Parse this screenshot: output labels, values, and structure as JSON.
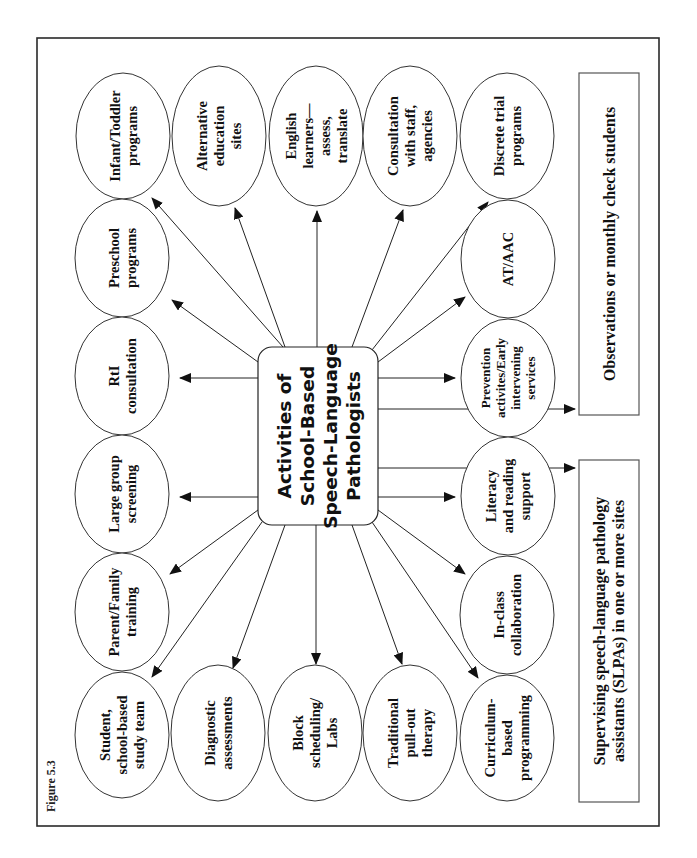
{
  "figure_label": "Figure 5.3",
  "center": {
    "lines": [
      "Activities of",
      "School-Based",
      "Speech-Language",
      "Pathologists"
    ]
  },
  "activities": {
    "infant_toddler": [
      "Infant/Toddler",
      "programs"
    ],
    "alternative_education": [
      "Alternative",
      "education",
      "sites"
    ],
    "english_learners": [
      "English",
      "learners—",
      "assess,",
      "translate"
    ],
    "consultation_staff": [
      "Consultation",
      "with staff,",
      "agencies"
    ],
    "discrete_trial": [
      "Discrete trial",
      "programs"
    ],
    "preschool": [
      "Preschool",
      "programs"
    ],
    "rti": [
      "RtI",
      "consultation"
    ],
    "large_group": [
      "Large group",
      "screening"
    ],
    "parent_family": [
      "Parent/Family",
      "training"
    ],
    "student_team": [
      "Student,",
      "school-based",
      "study team"
    ],
    "diagnostic": [
      "Diagnostic",
      "assessments"
    ],
    "block_scheduling": [
      "Block",
      "scheduling/",
      "Labs"
    ],
    "traditional_pullout": [
      "Traditional",
      "pull-out",
      "therapy"
    ],
    "curriculum_based": [
      "Curriculum-",
      "based",
      "programming"
    ],
    "in_class": [
      "In-class",
      "collaboration"
    ],
    "literacy": [
      "Literacy",
      "and reading",
      "support"
    ],
    "prevention": [
      "Prevention",
      "activites/Early",
      "intervening",
      "services"
    ],
    "at_aac": [
      "AT/AAC"
    ]
  },
  "side_boxes": {
    "observations": [
      "Observations or monthly check students"
    ],
    "supervising": [
      "Supervising speech-language pathology",
      "assistants (SLPAs) in one or more sites"
    ]
  },
  "colors": {
    "stroke": "#222222",
    "background": "#ffffff"
  }
}
